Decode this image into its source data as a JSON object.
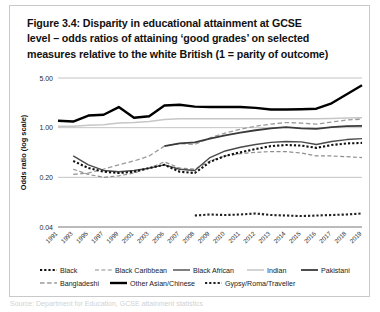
{
  "figure": {
    "title": "Figure 3.4: Disparity in educational attainment at GCSE level – odds ratios of attaining ‘good grades’ on selected measures relative to the white British (1 = parity of outcome)",
    "title_line1": "Figure 3.4: Disparity in educational attainment at GCSE",
    "title_line2": "level – odds ratios of attaining ‘good grades’ on selected",
    "title_line3": "measures relative to the white British (1 = parity of outcome)",
    "caption_cut": "Source: Department for Education, GCSE attainment statistics"
  },
  "chart_data": {
    "type": "line",
    "title": "Figure 3.4: Disparity in educational attainment at GCSE level – odds ratios of attaining ‘good grades’ on selected measures relative to the white British (1 = parity of outcome)",
    "xlabel": "",
    "ylabel": "Odds ratio (log scale)",
    "yscale": "log",
    "ylim": [
      0.04,
      5.0
    ],
    "yticks": [
      5.0,
      1.0,
      0.2,
      0.04
    ],
    "ytick_labels": [
      "5.00",
      "1.00",
      "0.20",
      "0.04"
    ],
    "grid": true,
    "legend_position": "bottom",
    "categories": [
      "1991",
      "1993",
      "1995",
      "1997",
      "1999",
      "2001",
      "2003",
      "2006",
      "2007",
      "2008",
      "2009",
      "2010",
      "2011",
      "2012",
      "2013",
      "2014",
      "2015",
      "2016",
      "2017",
      "2018",
      "2019"
    ],
    "series": [
      {
        "name": "Black",
        "style": "dotted-thick",
        "color": "#111111",
        "values": [
          null,
          0.34,
          0.27,
          0.24,
          0.23,
          0.24,
          0.27,
          0.3,
          0.24,
          0.23,
          0.33,
          0.4,
          0.45,
          0.5,
          0.55,
          0.57,
          0.56,
          0.52,
          0.57,
          0.6,
          0.61
        ]
      },
      {
        "name": "Black Caribbean",
        "style": "dashed-thin",
        "color": "#8d8d8d",
        "values": [
          null,
          0.26,
          0.22,
          0.2,
          0.21,
          0.23,
          0.27,
          0.33,
          0.27,
          0.26,
          0.34,
          0.4,
          0.43,
          0.45,
          0.46,
          0.46,
          0.44,
          0.4,
          0.4,
          0.39,
          0.38
        ]
      },
      {
        "name": "Black African",
        "style": "solid-medium",
        "color": "#4a4a4a",
        "values": [
          null,
          0.4,
          0.3,
          0.25,
          0.24,
          0.25,
          0.27,
          0.3,
          0.26,
          0.25,
          0.38,
          0.47,
          0.53,
          0.58,
          0.62,
          0.64,
          0.63,
          0.58,
          0.64,
          0.68,
          0.7
        ]
      },
      {
        "name": "Indian",
        "style": "solid-light",
        "color": "#c6c6c6",
        "values": [
          1.05,
          1.05,
          1.08,
          1.1,
          1.16,
          1.18,
          1.22,
          1.3,
          1.33,
          1.34,
          1.34,
          1.34,
          1.34,
          1.34,
          1.34,
          1.34,
          1.34,
          1.34,
          1.35,
          1.37,
          1.38
        ]
      },
      {
        "name": "Pakistani",
        "style": "solid-thick-dark",
        "color": "#3a3a3a",
        "values": [
          null,
          null,
          null,
          null,
          null,
          null,
          null,
          0.55,
          0.6,
          0.62,
          0.7,
          0.78,
          0.85,
          0.92,
          0.98,
          1.02,
          0.98,
          0.96,
          1.02,
          1.05,
          1.06
        ]
      },
      {
        "name": "Bangladeshi",
        "style": "dashed-light",
        "color": "#9a9a9a",
        "values": [
          null,
          0.22,
          0.23,
          0.26,
          0.3,
          0.34,
          0.4,
          0.55,
          0.6,
          0.58,
          0.72,
          0.84,
          0.95,
          1.05,
          1.12,
          1.18,
          1.16,
          1.12,
          1.2,
          1.28,
          1.32
        ]
      },
      {
        "name": "Other Asian/Chinese",
        "style": "solid-black-thick",
        "color": "#000000",
        "values": [
          1.25,
          1.22,
          1.48,
          1.52,
          1.95,
          1.38,
          1.45,
          2.05,
          2.1,
          1.98,
          1.95,
          1.95,
          1.95,
          1.9,
          1.8,
          1.8,
          1.82,
          1.85,
          2.2,
          2.95,
          3.95
        ]
      },
      {
        "name": "Gypsy/Roma/Traveller",
        "style": "dotted-thick",
        "color": "#222222",
        "values": [
          null,
          null,
          null,
          null,
          null,
          null,
          null,
          null,
          null,
          0.058,
          0.06,
          0.059,
          0.06,
          0.062,
          0.059,
          0.058,
          0.057,
          0.058,
          0.059,
          0.06,
          0.062
        ]
      }
    ],
    "legend": [
      {
        "label": "Black",
        "style": "dotted-thick",
        "color": "#111111"
      },
      {
        "label": "Black Caribbean",
        "style": "dashed-thin",
        "color": "#8d8d8d"
      },
      {
        "label": "Black African",
        "style": "solid-medium",
        "color": "#4a4a4a"
      },
      {
        "label": "Indian",
        "style": "solid-light",
        "color": "#c6c6c6"
      },
      {
        "label": "Pakistani",
        "style": "solid-thick-dark",
        "color": "#3a3a3a"
      },
      {
        "label": "Bangladeshi",
        "style": "dashed-light",
        "color": "#9a9a9a"
      },
      {
        "label": "Other Asian/Chinese",
        "style": "solid-black-thick",
        "color": "#000000"
      },
      {
        "label": "Gypsy/Roma/Traveller",
        "style": "dotted-thick",
        "color": "#222222"
      }
    ]
  },
  "legend_row1": [
    "Black",
    "Black Caribbean",
    "Black African",
    "Indian",
    "Pakistani"
  ],
  "legend_row2": [
    "Bangladeshi",
    "Other Asian/Chinese",
    "Gypsy/Roma/Traveller"
  ]
}
